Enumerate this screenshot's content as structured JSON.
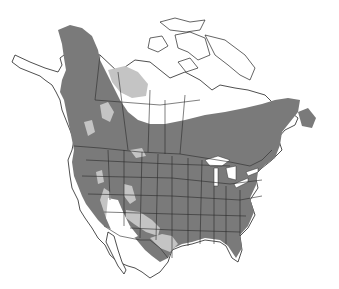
{
  "map": {
    "title": "",
    "region": "North America",
    "type": "species range map",
    "legend": [
      {
        "id": "primary",
        "meaning": "primary range",
        "color": "#7a7a7a"
      },
      {
        "id": "secondary",
        "meaning": "secondary range",
        "color": "#c4c4c4"
      }
    ],
    "colors": {
      "background": "#ffffff",
      "land": "#ffffff",
      "border": "#2a2a2a",
      "primary_range": "#7a7a7a",
      "secondary_range": "#c4c4c4"
    }
  }
}
